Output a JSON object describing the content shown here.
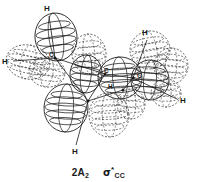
{
  "figure": {
    "kind": "molecular-orbital-diagram",
    "background_color": "#ffffff",
    "line_color": "#1a1a1a",
    "caption": {
      "symmetry_label": "2A",
      "symmetry_subscript": "2",
      "orbital_symbol": "σ",
      "orbital_star": "*",
      "orbital_subscript": "CC"
    },
    "atom_labels": [
      {
        "name": "h-top-left",
        "text": "H",
        "x": 44,
        "y": 5,
        "size": "normal"
      },
      {
        "name": "h-left",
        "text": "H",
        "x": 2,
        "y": 58,
        "size": "normal"
      },
      {
        "name": "h-top-right",
        "text": "H",
        "x": 142,
        "y": 29,
        "size": "normal"
      },
      {
        "name": "h-right",
        "text": "H",
        "x": 180,
        "y": 97,
        "size": "normal"
      },
      {
        "name": "h-center",
        "text": "H",
        "x": 108,
        "y": 84,
        "size": "small"
      },
      {
        "name": "h-bottom",
        "text": "H",
        "x": 72,
        "y": 148,
        "size": "normal"
      },
      {
        "name": "c-left",
        "text": "C",
        "x": 49,
        "y": 52,
        "size": "small"
      },
      {
        "name": "c-center",
        "text": "C",
        "x": 104,
        "y": 68,
        "size": "small"
      },
      {
        "name": "c-right",
        "text": "C",
        "x": 137,
        "y": 73,
        "size": "small"
      }
    ],
    "orbital_lobes": [
      {
        "name": "lobe-upper-left-solid",
        "cx": 56,
        "cy": 37,
        "rx": 21,
        "ry": 24,
        "rot": -8,
        "phase": "solid",
        "meridians": 4
      },
      {
        "name": "lobe-left-dashed",
        "cx": 28,
        "cy": 62,
        "rx": 22,
        "ry": 17,
        "rot": 12,
        "phase": "dashed",
        "meridians": 4
      },
      {
        "name": "lobe-leftlow-dashed",
        "cx": 47,
        "cy": 72,
        "rx": 18,
        "ry": 15,
        "rot": 8,
        "phase": "dashed",
        "meridians": 3
      },
      {
        "name": "lobe-midupper-dashed",
        "cx": 89,
        "cy": 54,
        "rx": 17,
        "ry": 20,
        "rot": -5,
        "phase": "dashed",
        "meridians": 4
      },
      {
        "name": "lobe-midleft-solid",
        "cx": 86,
        "cy": 74,
        "rx": 16,
        "ry": 19,
        "rot": 6,
        "phase": "solid",
        "meridians": 4
      },
      {
        "name": "lobe-center-solid",
        "cx": 120,
        "cy": 78,
        "rx": 22,
        "ry": 21,
        "rot": -4,
        "phase": "solid",
        "meridians": 5
      },
      {
        "name": "lobe-rightupper-dashed",
        "cx": 150,
        "cy": 50,
        "rx": 20,
        "ry": 19,
        "rot": -10,
        "phase": "dashed",
        "meridians": 4
      },
      {
        "name": "lobe-rightfar-dashed",
        "cx": 171,
        "cy": 66,
        "rx": 17,
        "ry": 18,
        "rot": 5,
        "phase": "dashed",
        "meridians": 4
      },
      {
        "name": "lobe-right-solid",
        "cx": 150,
        "cy": 80,
        "rx": 19,
        "ry": 20,
        "rot": 4,
        "phase": "solid",
        "meridians": 4
      },
      {
        "name": "lobe-rightlow-dashed",
        "cx": 166,
        "cy": 93,
        "rx": 15,
        "ry": 14,
        "rot": 0,
        "phase": "dashed",
        "meridians": 3
      },
      {
        "name": "lobe-bottomleft-solid",
        "cx": 66,
        "cy": 108,
        "rx": 22,
        "ry": 24,
        "rot": 3,
        "phase": "solid",
        "meridians": 5
      },
      {
        "name": "lobe-bottomright-dashed",
        "cx": 109,
        "cy": 115,
        "rx": 20,
        "ry": 22,
        "rot": -3,
        "phase": "dashed",
        "meridians": 5
      },
      {
        "name": "lobe-bottommid-dashed",
        "cx": 131,
        "cy": 104,
        "rx": 14,
        "ry": 15,
        "rot": 0,
        "phase": "dashed",
        "meridians": 3
      }
    ],
    "nuclei": [
      {
        "name": "nucleus-c-left",
        "x": 55,
        "y": 58
      },
      {
        "name": "nucleus-c-center",
        "x": 105,
        "y": 74
      },
      {
        "name": "nucleus-c-right",
        "x": 133,
        "y": 78
      },
      {
        "name": "nucleus-c-lower",
        "x": 88,
        "y": 101
      },
      {
        "name": "nucleus-c-mid",
        "x": 123,
        "y": 90
      }
    ],
    "bonds": [
      {
        "name": "bond-c-left-to-h-top",
        "x1": 55,
        "y1": 58,
        "x2": 49,
        "y2": 16
      },
      {
        "name": "bond-c-left-to-h-left",
        "x1": 55,
        "y1": 58,
        "x2": 13,
        "y2": 61
      },
      {
        "name": "bond-c-left-to-c-center",
        "x1": 55,
        "y1": 58,
        "x2": 105,
        "y2": 74
      },
      {
        "name": "bond-c-left-to-c-lower",
        "x1": 55,
        "y1": 58,
        "x2": 88,
        "y2": 101
      },
      {
        "name": "bond-c-center-to-c-right",
        "x1": 105,
        "y1": 74,
        "x2": 133,
        "y2": 78
      },
      {
        "name": "bond-c-center-to-c-lower",
        "x1": 105,
        "y1": 74,
        "x2": 88,
        "y2": 101
      },
      {
        "name": "bond-c-right-to-h-topr",
        "x1": 133,
        "y1": 78,
        "x2": 147,
        "y2": 40
      },
      {
        "name": "bond-c-right-to-h-right",
        "x1": 133,
        "y1": 78,
        "x2": 177,
        "y2": 99
      },
      {
        "name": "bond-c-right-to-c-mid",
        "x1": 133,
        "y1": 78,
        "x2": 123,
        "y2": 90
      },
      {
        "name": "bond-c-lower-to-h-bot",
        "x1": 88,
        "y1": 101,
        "x2": 76,
        "y2": 145
      },
      {
        "name": "bond-c-lower-to-c-mid",
        "x1": 88,
        "y1": 101,
        "x2": 123,
        "y2": 90
      }
    ]
  }
}
